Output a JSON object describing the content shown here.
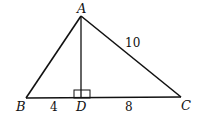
{
  "diagram": {
    "type": "geometry-triangle",
    "points": {
      "A": {
        "label": "A",
        "x": 81,
        "y": 16
      },
      "B": {
        "label": "B",
        "x": 26,
        "y": 98
      },
      "C": {
        "label": "C",
        "x": 181,
        "y": 97
      },
      "D": {
        "label": "D",
        "x": 81,
        "y": 98
      }
    },
    "segments": [
      {
        "from": "A",
        "to": "B"
      },
      {
        "from": "A",
        "to": "C",
        "label": "10"
      },
      {
        "from": "B",
        "to": "C"
      },
      {
        "from": "A",
        "to": "D",
        "note": "altitude, perpendicular to BC"
      }
    ],
    "lengths": {
      "BD": "4",
      "DC": "8",
      "AC": "10"
    },
    "right_angle_at": "D",
    "colors": {
      "stroke": "#111111",
      "background": "#ffffff"
    }
  }
}
